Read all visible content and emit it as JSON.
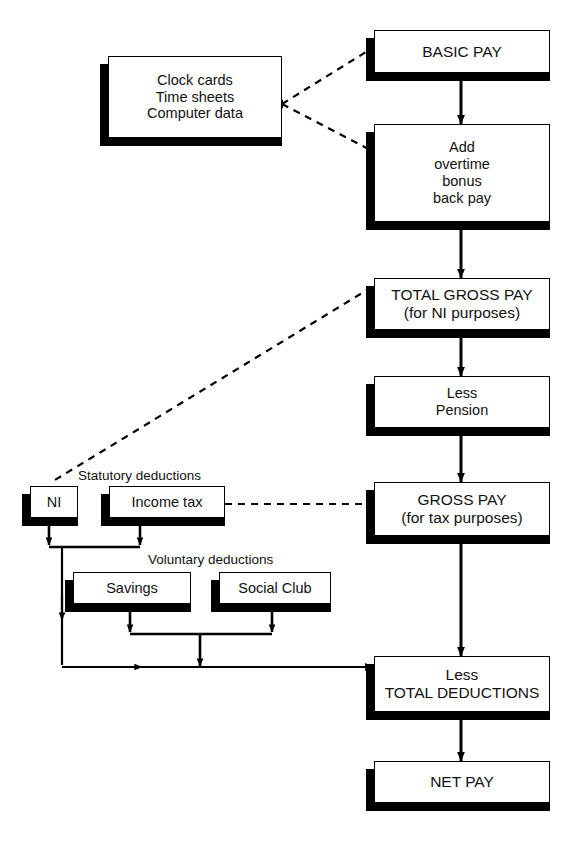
{
  "diagram": {
    "background_color": "#ffffff",
    "line_color": "#000000",
    "box_fill": "#ffffff",
    "shadow_color": "#000000"
  },
  "captions": [
    {
      "id": "statutory",
      "label": "Statutory deductions"
    },
    {
      "id": "voluntary",
      "label": "Voluntary deductions"
    }
  ],
  "nodes": [
    {
      "id": "sources",
      "label": "Clock cards\nTime sheets\nComputer data"
    },
    {
      "id": "basic_pay",
      "label": "BASIC PAY"
    },
    {
      "id": "additions",
      "label": "Add\novertime\nbonus\nback pay"
    },
    {
      "id": "total_gross_pay",
      "label": "TOTAL GROSS PAY\n(for NI purposes)"
    },
    {
      "id": "less_pension",
      "label": "Less\nPension"
    },
    {
      "id": "gross_pay",
      "label": "GROSS PAY\n(for tax purposes)"
    },
    {
      "id": "ni",
      "label": "NI"
    },
    {
      "id": "income_tax",
      "label": "Income tax"
    },
    {
      "id": "savings",
      "label": "Savings"
    },
    {
      "id": "social_club",
      "label": "Social Club"
    },
    {
      "id": "total_deductions",
      "label": "Less\nTOTAL DEDUCTIONS"
    },
    {
      "id": "net_pay",
      "label": "NET PAY"
    }
  ],
  "edges": [
    {
      "from": "sources",
      "to": "basic_pay",
      "style": "dashed"
    },
    {
      "from": "sources",
      "to": "additions",
      "style": "dashed"
    },
    {
      "from": "basic_pay",
      "to": "additions",
      "style": "solid"
    },
    {
      "from": "additions",
      "to": "total_gross_pay",
      "style": "solid"
    },
    {
      "from": "total_gross_pay",
      "to": "less_pension",
      "style": "solid"
    },
    {
      "from": "total_gross_pay",
      "to": "ni",
      "style": "dashed"
    },
    {
      "from": "less_pension",
      "to": "gross_pay",
      "style": "solid"
    },
    {
      "from": "income_tax",
      "to": "gross_pay",
      "style": "dashed"
    },
    {
      "from": "gross_pay",
      "to": "total_deductions",
      "style": "solid"
    },
    {
      "from": "ni",
      "to": "total_deductions",
      "style": "solid"
    },
    {
      "from": "income_tax",
      "to": "total_deductions",
      "style": "solid"
    },
    {
      "from": "savings",
      "to": "total_deductions",
      "style": "solid"
    },
    {
      "from": "social_club",
      "to": "total_deductions",
      "style": "solid"
    },
    {
      "from": "total_deductions",
      "to": "net_pay",
      "style": "solid"
    }
  ]
}
